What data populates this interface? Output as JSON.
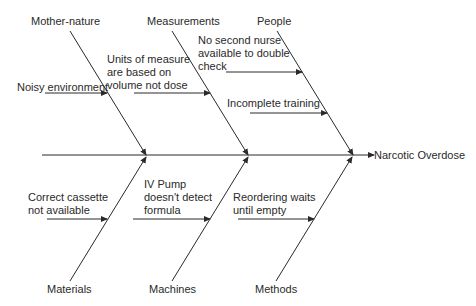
{
  "diagram": {
    "type": "fishbone",
    "effect": "Narcotic Overdose",
    "categories": {
      "top": [
        {
          "label": "Mother-nature",
          "causes": [
            "Noisy environment"
          ]
        },
        {
          "label": "Measurements",
          "causes": [
            "Units of measure\nare based on\nvolume not dose"
          ]
        },
        {
          "label": "People",
          "causes": [
            "No second nurse\navailable to double\ncheck",
            "Incomplete training"
          ]
        }
      ],
      "bottom": [
        {
          "label": "Materials",
          "causes": [
            "Correct cassette\nnot available"
          ]
        },
        {
          "label": "Machines",
          "causes": [
            "IV Pump\ndoesn't detect\nformula"
          ]
        },
        {
          "label": "Methods",
          "causes": [
            "Reordering waits\nuntil empty"
          ]
        }
      ]
    },
    "colors": {
      "line": "#2a2a2a",
      "text": "#2a2a2a",
      "background": "#ffffff"
    }
  }
}
